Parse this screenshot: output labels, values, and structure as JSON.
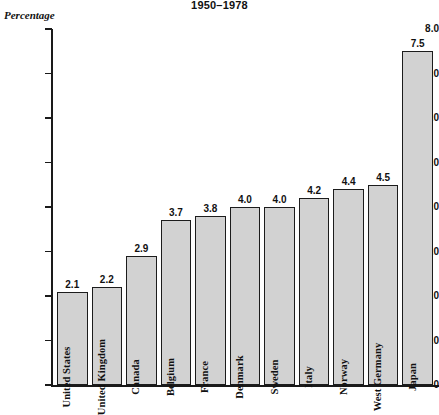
{
  "chart_data": {
    "type": "bar",
    "title": "1950–1978",
    "xlabel": "",
    "ylabel": "Percentage",
    "ylim": [
      0,
      8.0
    ],
    "yticks": [
      "0",
      "1.0",
      "2.0",
      "3.0",
      "4.0",
      "5.0",
      "6.0",
      "7.0",
      "8.0"
    ],
    "grid": false,
    "legend": "none",
    "bar_color": "#d2d2d2",
    "bar_edge_color": "#1c1c1c",
    "categories": [
      "United States",
      "United Kingdom",
      "Canada",
      "Belgium",
      "France",
      "Denmark",
      "Sweden",
      "Italy",
      "Norway",
      "West Germany",
      "Japan"
    ],
    "values": [
      2.1,
      2.2,
      2.9,
      3.7,
      3.8,
      4.0,
      4.0,
      4.2,
      4.4,
      4.5,
      7.5
    ],
    "value_labels": [
      "2.1",
      "2.2",
      "2.9",
      "3.7",
      "3.8",
      "4.0",
      "4.0",
      "4.2",
      "4.4",
      "4.5",
      "7.5"
    ]
  }
}
